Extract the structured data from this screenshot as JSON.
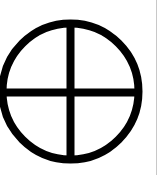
{
  "symbol": {
    "name": "circle-cross",
    "icon": "earth-sun-cross-icon",
    "stroke_color": "#000000",
    "background_color": "#ffffff"
  },
  "edge_line": {
    "color": "#c8c8c8"
  }
}
